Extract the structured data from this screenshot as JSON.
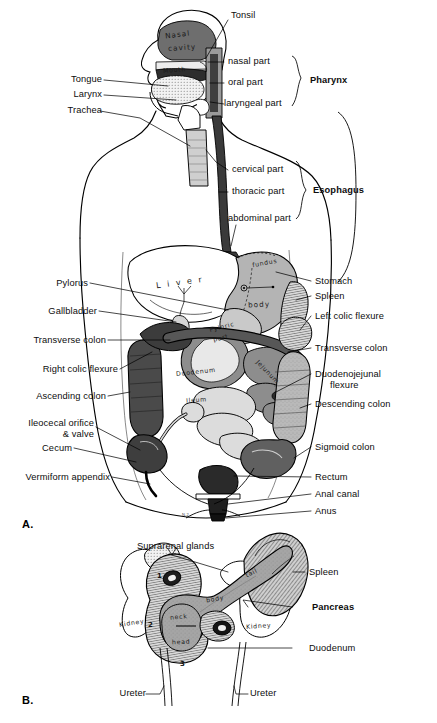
{
  "figure": {
    "type": "anatomical-illustration",
    "panels": [
      {
        "id": "A",
        "letter": "A.",
        "title": "Alimentary canal in situ"
      },
      {
        "id": "B",
        "letter": "B.",
        "title": "Pancreas, duodenum, spleen and kidneys"
      }
    ]
  },
  "panelA": {
    "head_labels_left": [
      {
        "id": "tongue",
        "text": "Tongue"
      },
      {
        "id": "larynx",
        "text": "Larynx"
      },
      {
        "id": "trachea",
        "text": "Trachea"
      }
    ],
    "head_labels_right": [
      {
        "id": "tonsil",
        "text": "Tonsil"
      },
      {
        "id": "nasal-part",
        "text": "nasal part"
      },
      {
        "id": "oral-part",
        "text": "oral part"
      },
      {
        "id": "laryngeal-part",
        "text": "laryngeal part"
      }
    ],
    "bracket_pharynx": "Pharynx",
    "esophagus_parts": [
      {
        "id": "cervical-part",
        "text": "cervical part"
      },
      {
        "id": "thoracic-part",
        "text": "thoracic part"
      },
      {
        "id": "abdominal-part",
        "text": "abdominal part"
      }
    ],
    "bracket_esophagus": "Esophagus",
    "labels_left": [
      {
        "id": "pylorus",
        "text": "Pylorus"
      },
      {
        "id": "gallbladder",
        "text": "Gallbladder"
      },
      {
        "id": "transverse-colon",
        "text": "Transverse colon"
      },
      {
        "id": "right-colic-flexure",
        "text": "Right colic flexure"
      },
      {
        "id": "ascending-colon",
        "text": "Ascending colon"
      },
      {
        "id": "ileocecal-orifice",
        "text": "Ileocecal orifice",
        "text2": "& valve"
      },
      {
        "id": "cecum",
        "text": "Cecum"
      },
      {
        "id": "vermiform-appendix",
        "text": "Vermiform appendix"
      }
    ],
    "labels_right": [
      {
        "id": "stomach",
        "text": "Stomach"
      },
      {
        "id": "spleen",
        "text": "Spleen"
      },
      {
        "id": "left-colic-flexure",
        "text": "Left colic flexure"
      },
      {
        "id": "transverse-colon-r",
        "text": "Transverse colon"
      },
      {
        "id": "duodenojejunal-flexure",
        "text": "Duodenojejunal",
        "text2": "flexure"
      },
      {
        "id": "descending-colon",
        "text": "Descending colon"
      },
      {
        "id": "sigmoid-colon",
        "text": "Sigmoid colon"
      },
      {
        "id": "rectum",
        "text": "Rectum"
      },
      {
        "id": "anal-canal",
        "text": "Anal canal"
      },
      {
        "id": "anus",
        "text": "Anus"
      }
    ],
    "in_figure_labels": [
      {
        "id": "nasal-cavity-a",
        "text": "Nasal"
      },
      {
        "id": "nasal-cavity-b",
        "text": "cavity"
      },
      {
        "id": "mouth",
        "text": "Mouth"
      },
      {
        "id": "liver",
        "text": "L i v e r"
      },
      {
        "id": "fundus",
        "text": "fundus"
      },
      {
        "id": "body",
        "text": "body"
      },
      {
        "id": "pyloric-part-a",
        "text": "Pyloric"
      },
      {
        "id": "pyloric-part-b",
        "text": "part"
      },
      {
        "id": "duodenum",
        "text": "Duodenum"
      },
      {
        "id": "jejunum",
        "text": "Jejunum"
      },
      {
        "id": "ileum",
        "text": "Ileum"
      },
      {
        "id": "signature",
        "text": "N.2."
      }
    ]
  },
  "panelB": {
    "labels": [
      {
        "id": "suprarenal-glands",
        "text": "Suprarenal glands"
      },
      {
        "id": "spleen-b",
        "text": "Spleen"
      },
      {
        "id": "pancreas",
        "text": "Pancreas",
        "bold": true
      },
      {
        "id": "duodenum-b",
        "text": "Duodenum"
      },
      {
        "id": "ureter-left",
        "text": "Ureter"
      },
      {
        "id": "ureter-right",
        "text": "Ureter"
      }
    ],
    "in_figure_labels": [
      {
        "id": "kidney-left",
        "text": "Kidney"
      },
      {
        "id": "kidney-right",
        "text": "Kidney"
      },
      {
        "id": "tail",
        "text": "tail"
      },
      {
        "id": "body-b",
        "text": "body"
      },
      {
        "id": "neck",
        "text": "neck"
      },
      {
        "id": "head-b",
        "text": "head"
      }
    ],
    "duodenum_parts": [
      {
        "id": "part-1",
        "text": "1"
      },
      {
        "id": "part-2",
        "text": "2"
      },
      {
        "id": "part-3",
        "text": "3"
      }
    ]
  },
  "colors": {
    "page_background": "#ffffff",
    "ink": "#000000",
    "esophagus_dark": "#3a3a3a",
    "stomach_gray": "#b4b4b4",
    "colon_dark": "#4a4a4a",
    "colon_mid": "#7c7c7c",
    "small_intestine_light": "#dcdcdc",
    "nasal_cavity_gray": "#6e6e6e",
    "pancreas_gray": "#9a9a9a",
    "spleen_hatch": "#8c8c8c"
  }
}
